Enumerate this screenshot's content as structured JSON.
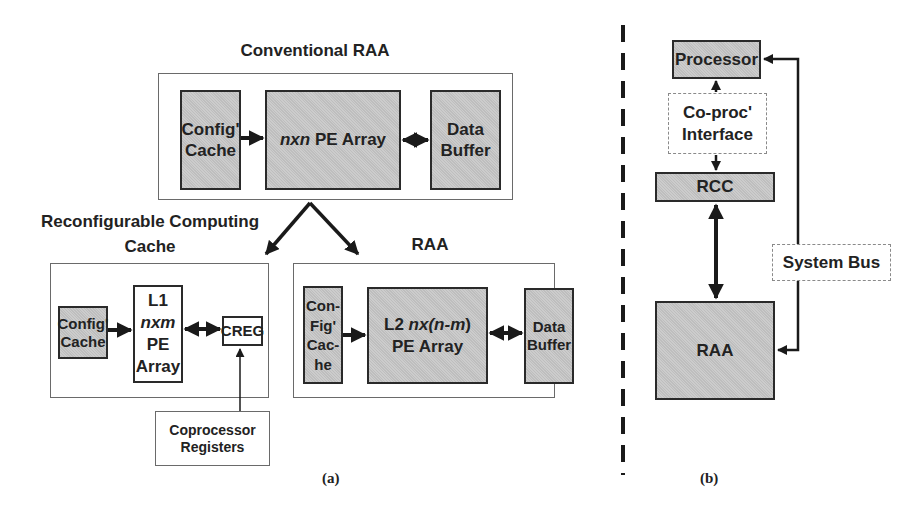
{
  "panel_a": {
    "caption": "(a)",
    "conventional_raa": {
      "title": "Conventional RAA",
      "config_cache": {
        "line1": "Config'",
        "line2": "Cache"
      },
      "pe_array": {
        "prefix": "nxn",
        "suffix": " PE Array"
      },
      "data_buffer": {
        "line1": "Data",
        "line2": "Buffer"
      }
    },
    "rcc": {
      "title_line1": "Reconfigurable Computing",
      "title_line2": "Cache",
      "config_cache": {
        "line1": "Config'",
        "line2": "Cache"
      },
      "l1_array": {
        "line1": "L1",
        "line2": "nxm",
        "line3": "PE",
        "line4": "Array"
      },
      "creg": "CREG",
      "coprocessor_registers": {
        "line1": "Coprocessor",
        "line2": "Registers"
      }
    },
    "raa": {
      "title": "RAA",
      "config_cache": {
        "line1": "Con-",
        "line2": "Fig'",
        "line3": "Cac-",
        "line4": "he"
      },
      "l2_array": {
        "prefix": "L2 ",
        "n1": "nx(",
        "n2": "n-m",
        "n3": ")",
        "line2": "PE Array"
      },
      "data_buffer": {
        "line1": "Data",
        "line2": "Buffer"
      }
    }
  },
  "panel_b": {
    "caption": "(b)",
    "processor": "Processor",
    "coproc_interface": {
      "line1": "Co-proc'",
      "line2": "Interface"
    },
    "rcc": "RCC",
    "raa": "RAA",
    "system_bus": "System Bus"
  },
  "colors": {
    "block_fill": "#c8c8c8",
    "block_border": "#2a2a2a",
    "frame_border": "#6a6a6a",
    "arrow": "#1a1a1a"
  }
}
